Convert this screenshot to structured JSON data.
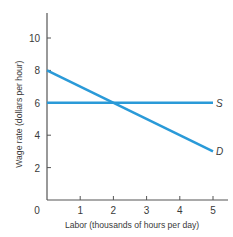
{
  "chart_data": {
    "type": "line",
    "title": "",
    "xlabel": "Labor (thousands of hours per day)",
    "ylabel": "Wage rate (dollars per hour)",
    "xlim": [
      0,
      5
    ],
    "ylim": [
      0,
      11
    ],
    "x_ticks": [
      "0",
      "1",
      "2",
      "3",
      "4",
      "5"
    ],
    "y_ticks": [
      "2",
      "4",
      "6",
      "8",
      "10"
    ],
    "grid": false,
    "legend": "inline labels at right end of lines",
    "series": [
      {
        "name": "S",
        "label": "S",
        "color": "#2a9ad8",
        "x": [
          0,
          5
        ],
        "y": [
          6,
          6
        ]
      },
      {
        "name": "D",
        "label": "D",
        "color": "#2a9ad8",
        "x": [
          0,
          5
        ],
        "y": [
          8,
          3
        ]
      }
    ],
    "annotations": [
      {
        "type": "equilibrium",
        "x": 2,
        "y": 6
      }
    ]
  }
}
